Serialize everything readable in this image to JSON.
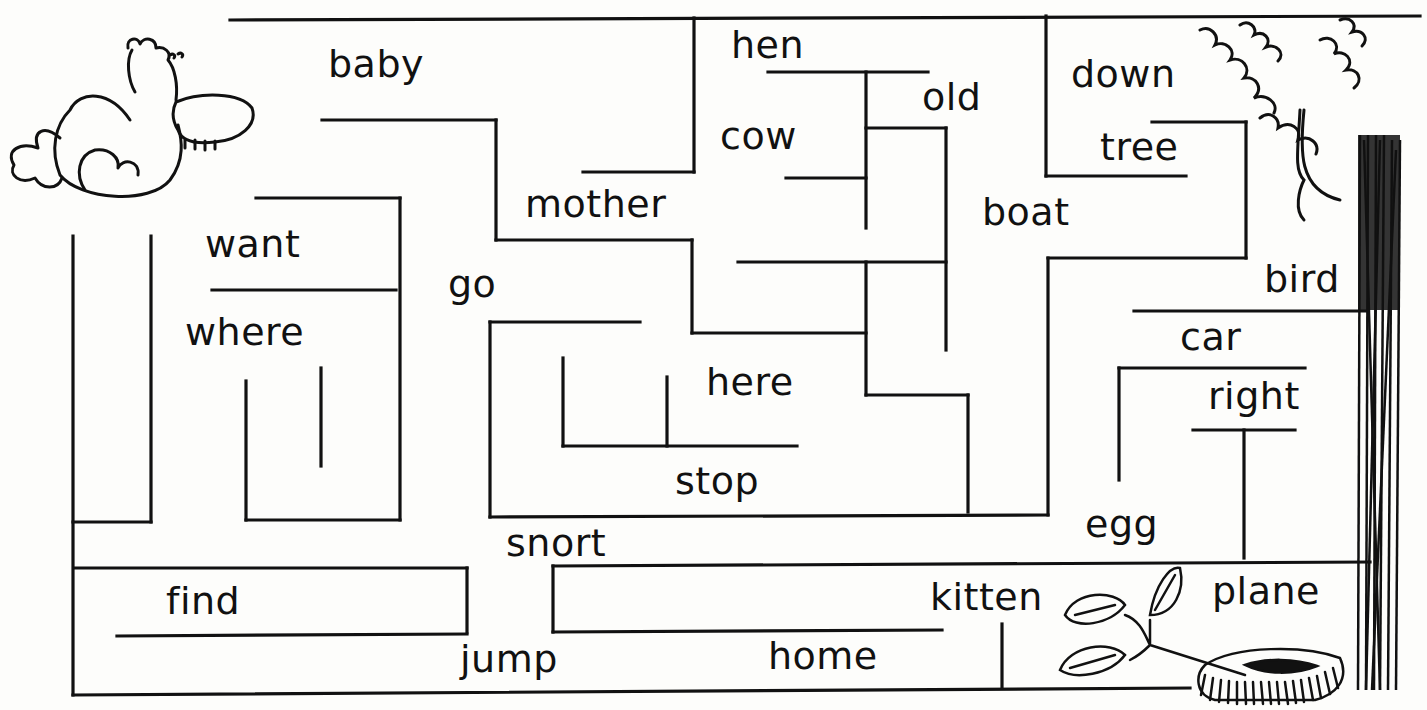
{
  "worksheet": {
    "type": "word maze",
    "start_illustration": "bird-icon",
    "end_illustration": "nest-icon",
    "words": [
      {
        "text": "baby",
        "x": 328,
        "y": 45
      },
      {
        "text": "hen",
        "x": 731,
        "y": 26
      },
      {
        "text": "old",
        "x": 922,
        "y": 78
      },
      {
        "text": "down",
        "x": 1071,
        "y": 55
      },
      {
        "text": "cow",
        "x": 720,
        "y": 117
      },
      {
        "text": "tree",
        "x": 1100,
        "y": 128
      },
      {
        "text": "mother",
        "x": 525,
        "y": 185
      },
      {
        "text": "boat",
        "x": 982,
        "y": 193
      },
      {
        "text": "want",
        "x": 205,
        "y": 225
      },
      {
        "text": "go",
        "x": 448,
        "y": 265
      },
      {
        "text": "bird",
        "x": 1264,
        "y": 260
      },
      {
        "text": "where",
        "x": 185,
        "y": 313
      },
      {
        "text": "car",
        "x": 1180,
        "y": 318
      },
      {
        "text": "here",
        "x": 706,
        "y": 363
      },
      {
        "text": "right",
        "x": 1208,
        "y": 377
      },
      {
        "text": "stop",
        "x": 675,
        "y": 462
      },
      {
        "text": "egg",
        "x": 1085,
        "y": 505
      },
      {
        "text": "snort",
        "x": 506,
        "y": 524
      },
      {
        "text": "find",
        "x": 166,
        "y": 582
      },
      {
        "text": "kitten",
        "x": 930,
        "y": 578
      },
      {
        "text": "plane",
        "x": 1212,
        "y": 572
      },
      {
        "text": "jump",
        "x": 460,
        "y": 640
      },
      {
        "text": "home",
        "x": 768,
        "y": 637
      }
    ],
    "walls": [
      [
        230,
        20,
        1420,
        16
      ],
      [
        694,
        18,
        694,
        172
      ],
      [
        583,
        172,
        694,
        172
      ],
      [
        1046,
        16,
        1046,
        176
      ],
      [
        1046,
        176,
        1186,
        176
      ],
      [
        1152,
        122,
        1246,
        122
      ],
      [
        1246,
        122,
        1246,
        258
      ],
      [
        1246,
        258,
        1048,
        258
      ],
      [
        1048,
        258,
        1048,
        515
      ],
      [
        322,
        120,
        496,
        120
      ],
      [
        496,
        120,
        496,
        240
      ],
      [
        496,
        240,
        692,
        240
      ],
      [
        692,
        240,
        692,
        333
      ],
      [
        692,
        333,
        866,
        333
      ],
      [
        768,
        72,
        928,
        72
      ],
      [
        866,
        72,
        866,
        228
      ],
      [
        866,
        128,
        946,
        128
      ],
      [
        946,
        128,
        946,
        350
      ],
      [
        786,
        178,
        866,
        178
      ],
      [
        738,
        262,
        946,
        262
      ],
      [
        866,
        262,
        866,
        395
      ],
      [
        866,
        395,
        968,
        395
      ],
      [
        968,
        395,
        968,
        512
      ],
      [
        490,
        322,
        640,
        322
      ],
      [
        490,
        322,
        490,
        517
      ],
      [
        490,
        517,
        1048,
        515
      ],
      [
        563,
        358,
        563,
        446
      ],
      [
        563,
        446,
        797,
        446
      ],
      [
        667,
        377,
        667,
        446
      ],
      [
        73,
        236,
        73,
        695
      ],
      [
        73,
        522,
        151,
        522
      ],
      [
        151,
        236,
        151,
        522
      ],
      [
        256,
        198,
        400,
        198
      ],
      [
        400,
        198,
        400,
        520
      ],
      [
        212,
        290,
        396,
        290
      ],
      [
        246,
        381,
        246,
        520
      ],
      [
        246,
        520,
        400,
        520
      ],
      [
        321,
        368,
        321,
        466
      ],
      [
        75,
        568,
        467,
        568
      ],
      [
        467,
        568,
        467,
        632
      ],
      [
        117,
        636,
        467,
        634
      ],
      [
        73,
        695,
        1190,
        688
      ],
      [
        553,
        566,
        553,
        632
      ],
      [
        553,
        566,
        1370,
        562
      ],
      [
        553,
        632,
        942,
        630
      ],
      [
        1002,
        624,
        1002,
        688
      ],
      [
        1134,
        311,
        1368,
        311
      ],
      [
        1119,
        368,
        1305,
        368
      ],
      [
        1119,
        368,
        1119,
        480
      ],
      [
        1193,
        430,
        1295,
        430
      ],
      [
        1244,
        430,
        1244,
        558
      ]
    ],
    "colors": {
      "ink": "#111111",
      "paper": "#fdfdfb"
    }
  }
}
